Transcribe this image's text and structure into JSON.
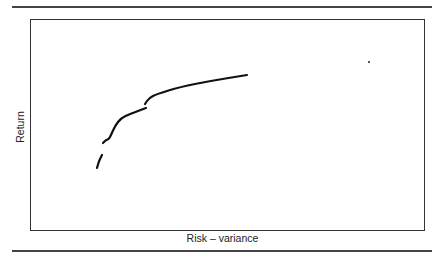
{
  "chart_data": {
    "type": "line",
    "title": "",
    "xlabel": "Risk – variance",
    "ylabel": "Return",
    "grid": false,
    "legend": null,
    "axis_ticks": "none",
    "series": [
      {
        "name": "frontier-segment-1",
        "points_px": [
          [
            97,
            168
          ],
          [
            99,
            161
          ],
          [
            102,
            155
          ]
        ]
      },
      {
        "name": "frontier-segment-2",
        "points_px": [
          [
            103,
            143
          ],
          [
            106,
            140
          ],
          [
            109,
            139
          ],
          [
            111,
            135
          ],
          [
            115,
            126
          ],
          [
            121,
            118
          ],
          [
            130,
            114
          ],
          [
            146,
            108
          ]
        ]
      },
      {
        "name": "frontier-segment-3",
        "points_px": [
          [
            145,
            104
          ],
          [
            149,
            98
          ],
          [
            157,
            94
          ],
          [
            180,
            87
          ],
          [
            210,
            81
          ],
          [
            247,
            75
          ]
        ]
      }
    ],
    "isolated_point_px": [
      369,
      62
    ],
    "colors": {
      "line": "#111111",
      "frame": "#333333",
      "rules": "#444444",
      "background": "#ffffff"
    }
  }
}
